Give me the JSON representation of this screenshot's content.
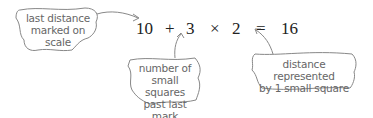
{
  "equation": {
    "terms": [
      "10",
      "+",
      "3",
      "×",
      "2",
      "=",
      "16"
    ]
  },
  "annotations": [
    {
      "id": "last-distance",
      "lines": [
        "last distance",
        "marked on",
        "scale"
      ],
      "points_to": "10"
    },
    {
      "id": "small-squares",
      "lines": [
        "number of",
        "small squares",
        "past last",
        "mark"
      ],
      "points_to": "3"
    },
    {
      "id": "distance-per-square",
      "lines": [
        "distance represented",
        "by 1 small square"
      ],
      "points_to": "2"
    }
  ]
}
